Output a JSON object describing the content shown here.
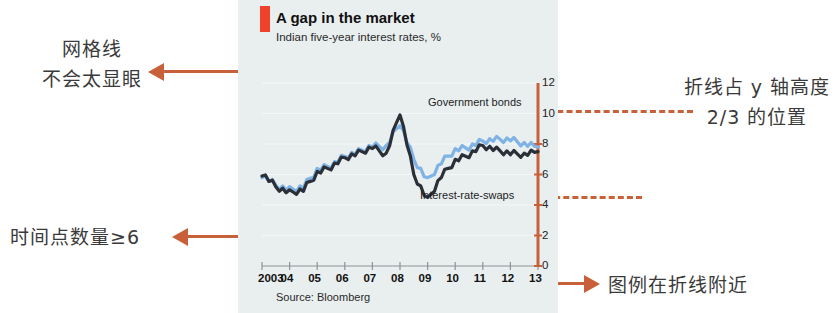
{
  "annotations": {
    "gridline": {
      "line1": "网格线",
      "line2": "不会太显眼"
    },
    "timepoints": {
      "text": "时间点数量≥6"
    },
    "ratio": {
      "line1": "折线占 y 轴高度",
      "line2": "2/3 的位置"
    },
    "legend": {
      "text": "图例在折线附近"
    }
  },
  "colors": {
    "annotation_orange": "#c8603a",
    "panel_background": "#e9eeef",
    "title_tab_red": "#f0422a",
    "series_government_bonds": "#7fb2e5",
    "series_interest_rate_swaps": "#2b2f38"
  },
  "chart_data": {
    "type": "line",
    "title": "A gap in the market",
    "subtitle": "Indian five-year interest rates, %",
    "source": "Source: Bloomberg",
    "xlabel": "",
    "ylabel": "",
    "ylim": [
      0,
      12
    ],
    "y_ticks": [
      0,
      2,
      4,
      6,
      8,
      10,
      12
    ],
    "y_axis_position": "right",
    "grid": "faint-horizontal",
    "legend_position": "inline-near-lines",
    "x_tick_labels": [
      "2003",
      "04",
      "05",
      "06",
      "07",
      "08",
      "09",
      "10",
      "11",
      "12",
      "13"
    ],
    "x": [
      2003,
      2003.5,
      2004,
      2004.5,
      2005,
      2005.5,
      2006,
      2006.5,
      2007,
      2007.5,
      2008,
      2008.5,
      2009,
      2009.5,
      2010,
      2010.5,
      2011,
      2011.5,
      2012,
      2012.5,
      2013
    ],
    "series": [
      {
        "name": "Government bonds",
        "color": "#7fb2e5",
        "values": [
          6.0,
          5.3,
          5.0,
          5.2,
          6.3,
          6.6,
          7.2,
          7.5,
          7.9,
          7.8,
          9.4,
          7.0,
          5.6,
          6.8,
          7.6,
          7.8,
          8.2,
          8.3,
          8.3,
          8.0,
          7.8
        ]
      },
      {
        "name": "Interest-rate-swaps",
        "color": "#2b2f38",
        "values": [
          6.1,
          5.2,
          4.8,
          5.0,
          6.1,
          6.5,
          7.1,
          7.4,
          7.8,
          7.3,
          10.1,
          6.0,
          4.3,
          5.9,
          6.9,
          7.3,
          7.9,
          7.6,
          7.4,
          7.3,
          7.5
        ]
      }
    ],
    "callout_lines": [
      {
        "label": "government-bonds-callout",
        "y_value": 10
      },
      {
        "label": "interest-rate-swaps-callout",
        "y_value": 5
      }
    ]
  }
}
